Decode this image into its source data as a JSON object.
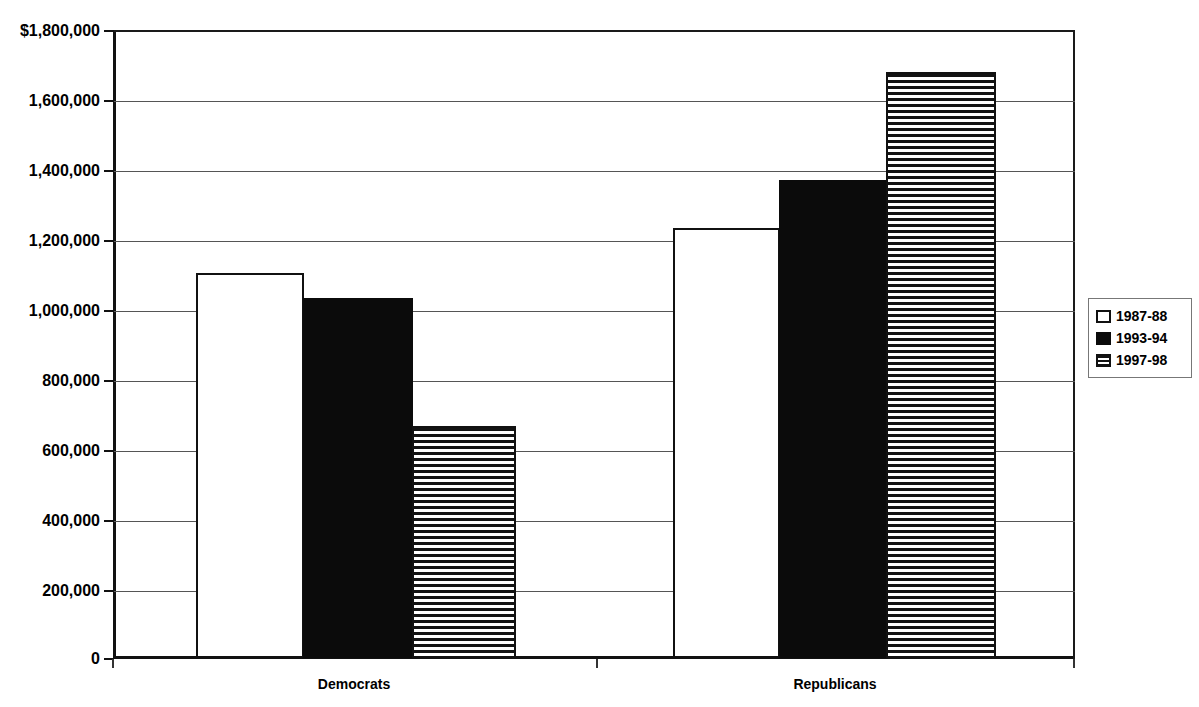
{
  "chart_data": {
    "type": "bar",
    "title": "",
    "subtitle": "",
    "xlabel": "",
    "ylabel": "",
    "categories": [
      "Democrats",
      "Republicans"
    ],
    "series": [
      {
        "name": "1987-88",
        "values": [
          1106000,
          1234000
        ],
        "fill": "open"
      },
      {
        "name": "1993-94",
        "values": [
          1034000,
          1371000
        ],
        "fill": "solid"
      },
      {
        "name": "1997-98",
        "values": [
          666000,
          1683000
        ],
        "fill": "striped"
      }
    ],
    "ylim": [
      0,
      1800000
    ],
    "ytick_step": 200000,
    "ytick_labels": [
      "$1,800,000",
      "1,600,000",
      "1,400,000",
      "1,200,000",
      "1,000,000",
      "800,000",
      "600,000",
      "400,000",
      "200,000",
      "0"
    ],
    "ytick_values": [
      1800000,
      1600000,
      1400000,
      1200000,
      1000000,
      800000,
      600000,
      400000,
      200000,
      0
    ],
    "grid": true,
    "grid_axis": "y",
    "legend_position": "right",
    "colors": {
      "axis": "#111111",
      "grid": "#555555",
      "bar_open_fill": "#ffffff",
      "bar_open_border": "#111111",
      "bar_solid_fill": "#0b0b0b",
      "bar_striped_fill": "#131313",
      "background": "#ffffff",
      "text": "#000000"
    }
  },
  "legend": {
    "items": [
      {
        "label": "1987-88",
        "swatch": "open-square-icon"
      },
      {
        "label": "1993-94",
        "swatch": "filled-square-icon"
      },
      {
        "label": "1997-98",
        "swatch": "striped-square-icon"
      }
    ]
  },
  "axes": {
    "x_categories": [
      "Democrats",
      "Republicans"
    ]
  }
}
